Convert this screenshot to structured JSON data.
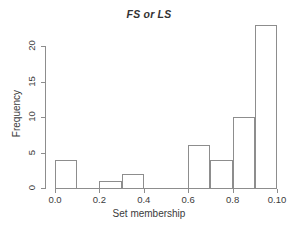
{
  "chart_data": {
    "type": "bar",
    "title": "FS or LS",
    "xlabel": "Set membership",
    "ylabel": "Frequency",
    "xlim": [
      0.0,
      1.0
    ],
    "ylim": [
      0,
      23
    ],
    "grid": false,
    "legend": false,
    "bin_width": 0.1,
    "bin_edges": [
      0.0,
      0.1,
      0.2,
      0.3,
      0.4,
      0.5,
      0.6,
      0.7,
      0.8,
      0.9,
      1.0
    ],
    "categories": [
      "0.0-0.1",
      "0.1-0.2",
      "0.2-0.3",
      "0.3-0.4",
      "0.4-0.5",
      "0.5-0.6",
      "0.6-0.7",
      "0.7-0.8",
      "0.8-0.9",
      "0.9-1.0"
    ],
    "values": [
      4,
      0,
      1,
      2,
      0,
      0,
      6,
      4,
      10,
      23
    ],
    "xticks": [
      0.0,
      0.2,
      0.4,
      0.6,
      0.8,
      1.0
    ],
    "xtick_labels": [
      "0.0",
      "0.2",
      "0.4",
      "0.6",
      "0.8",
      "0.10"
    ],
    "yticks": [
      0,
      5,
      10,
      15,
      20
    ],
    "ytick_labels": [
      "0",
      "5",
      "10",
      "15",
      "20"
    ],
    "bar_fill": "#ffffff",
    "bar_stroke": "#8d8d8d",
    "axis_color": "#8d8d8d",
    "text_color": "#3b3b3b",
    "background": "#ffffff"
  }
}
